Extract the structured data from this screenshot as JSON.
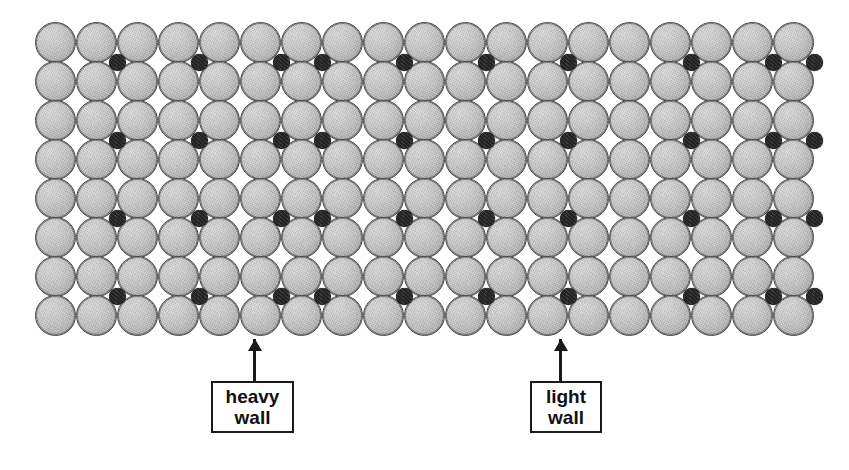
{
  "figure": {
    "width": 849,
    "height": 470,
    "background": "#ffffff",
    "host_sphere_color": "#c3c3c3",
    "host_outline_color": "#4a4a4a",
    "interstitial_color": "#232323"
  },
  "lattice": {
    "origin_x": 35,
    "origin_y": 22,
    "sphere_diameter": 41,
    "column_pitch": 41,
    "row_pitch": 39,
    "columns": 19,
    "rows": 8,
    "interstitial_diameter": 17,
    "interstitial_row_indices": [
      0,
      2,
      4,
      6
    ],
    "interstitial_columns": [
      1,
      3,
      5,
      6,
      8,
      10,
      12,
      15,
      17,
      18
    ]
  },
  "callouts": [
    {
      "name": "heavy-wall",
      "line1": "heavy",
      "line2": "wall",
      "box_left": 211,
      "box_top": 381,
      "box_width": 83,
      "box_height": 52,
      "arrow_x": 253,
      "arrow_top": 339,
      "arrow_height": 42
    },
    {
      "name": "light-wall",
      "line1": "light",
      "line2": "wall",
      "box_left": 530,
      "box_top": 381,
      "box_width": 72,
      "box_height": 52,
      "arrow_x": 559,
      "arrow_top": 339,
      "arrow_height": 42
    }
  ]
}
